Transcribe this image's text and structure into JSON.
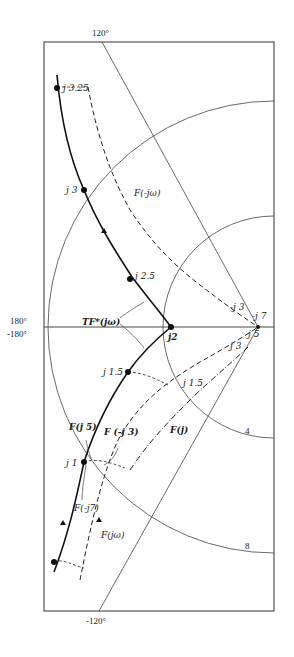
{
  "diagram": {
    "type": "nichols-style frequency plot",
    "angles": {
      "top": "120°",
      "left_upper": "180°",
      "left_lower": "-180°",
      "bottom": "-120°"
    },
    "circle_labels": {
      "inner": "4",
      "outer": "8"
    },
    "curves": {
      "tf_star": "TF*(jω)",
      "f_minus_jw": "F(-jω)",
      "f_jw": "F(jω)",
      "f_j": "F(j)",
      "f_j5": "F(j 5)",
      "f_minus_j3": "F  (-j 3)",
      "f_minus_j7": "F(-j7)"
    },
    "points": {
      "j325": "j 3.25",
      "j3": "j 3",
      "j25": "j 2.5",
      "j2": "j2",
      "j15": "j 1.5",
      "j1": "j 1",
      "mj3": "-j 3",
      "mj7": "-j 7",
      "j3b": "j 3",
      "j5": "j 5",
      "j15b": "j 1.5"
    }
  }
}
